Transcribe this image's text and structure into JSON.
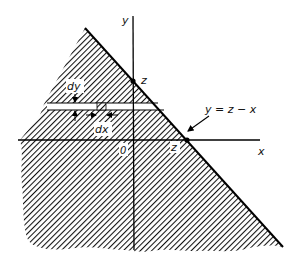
{
  "diagram": {
    "type": "integration-region",
    "colors": {
      "hatch": "#111111",
      "background": "#ffffff",
      "line": "#000000"
    },
    "axes": {
      "x_label": "x",
      "y_label": "y",
      "origin_label": "0"
    },
    "boundary_line": {
      "label": "y = z − x"
    },
    "intercepts": {
      "y_intercept_label": "z",
      "x_intercept_label": "z"
    },
    "strip": {
      "height_label": "dy",
      "width_label": "dx"
    }
  }
}
